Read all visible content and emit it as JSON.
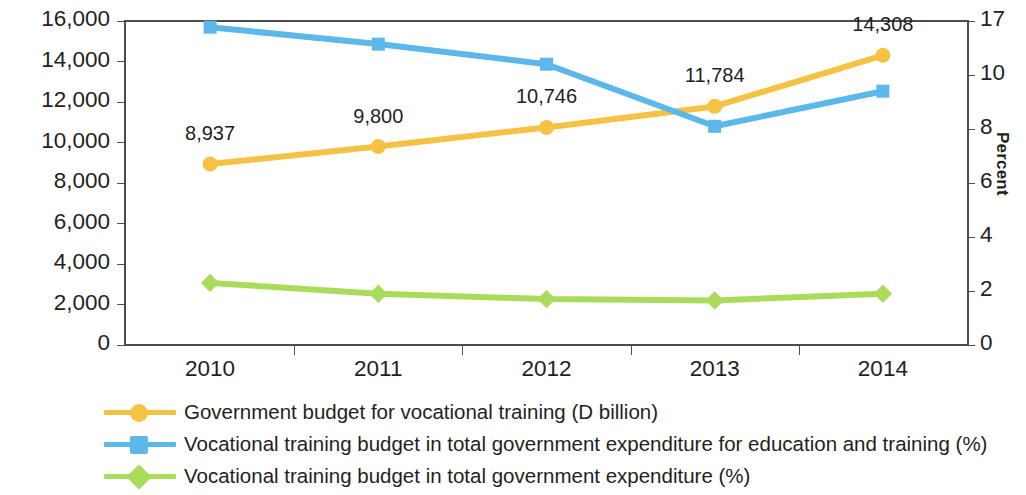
{
  "chart_data": {
    "type": "line",
    "title": "",
    "xlabel": "",
    "ylabel": "",
    "categories": [
      "2010",
      "2011",
      "2012",
      "2013",
      "2014"
    ],
    "grid": false,
    "legend_position": "bottom",
    "axes": {
      "left": {
        "ylim": [
          0,
          16000
        ],
        "ticks": [
          "0",
          "2,000",
          "4,000",
          "6,000",
          "8,000",
          "10,000",
          "12,000",
          "14,000",
          "16,000"
        ],
        "tick_values": [
          0,
          2000,
          4000,
          6000,
          8000,
          10000,
          12000,
          14000,
          16000
        ],
        "title": ""
      },
      "right": {
        "ylim": [
          0,
          12
        ],
        "ticks": [
          "0",
          "2",
          "4",
          "6",
          "8",
          "10",
          "17"
        ],
        "tick_values": [
          0,
          2,
          4,
          6,
          8,
          10,
          17
        ],
        "title": "Percent"
      }
    },
    "series": [
      {
        "name": "Government budget for  vocational training (D billion)",
        "axis": "left",
        "color": "#f6c243",
        "marker": "circle",
        "values": [
          8937,
          9800,
          10746,
          11784,
          14308
        ],
        "labels": [
          "8,937",
          "9,800",
          "10,746",
          "11,784",
          "14,308"
        ]
      },
      {
        "name": "Vocational training budget in total government expenditure for education and training (%)",
        "axis": "right",
        "color": "#5cb8ea",
        "marker": "square",
        "values": [
          16.2,
          14.0,
          11.4,
          8.1,
          9.4
        ],
        "labels": [
          "",
          "",
          "",
          "",
          ""
        ]
      },
      {
        "name": "Vocational training budget in total government expenditure (%)",
        "axis": "right",
        "color": "#a8dc5a",
        "marker": "diamond",
        "values": [
          2.3,
          1.9,
          1.7,
          1.65,
          1.9
        ],
        "labels": [
          "",
          "",
          "",
          "",
          ""
        ]
      }
    ]
  },
  "legend": {
    "items": [
      {
        "label": "Government budget for  vocational training (D billion)",
        "color": "#f6c243",
        "marker": "circle"
      },
      {
        "label": "Vocational training budget in total government expenditure for education and training (%)",
        "color": "#5cb8ea",
        "marker": "square"
      },
      {
        "label": "Vocational training budget in total government expenditure (%)",
        "color": "#a8dc5a",
        "marker": "diamond"
      }
    ]
  }
}
